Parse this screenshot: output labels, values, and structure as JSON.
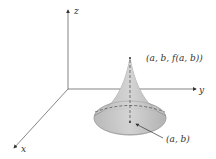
{
  "diagram": {
    "type": "3d-surface-sketch",
    "axes": {
      "x_label": "x",
      "y_label": "y",
      "z_label": "z"
    },
    "labels": {
      "peak_point": "(a, b, f(a, b))",
      "base_point": "(a, b)"
    },
    "colors": {
      "surface_fill": "#c8c8c8",
      "axis": "#555555",
      "text": "#333333"
    }
  }
}
